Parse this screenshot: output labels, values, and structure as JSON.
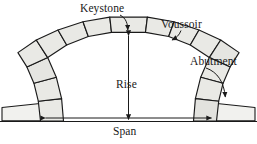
{
  "diagram": {
    "type": "engineering-cross-section",
    "colors": {
      "stone_fill": "#e9e9e5",
      "stone_fill_alt": "#dededa",
      "outline": "#1a1a1a",
      "background": "#ffffff",
      "text": "#1a1a1a"
    },
    "labels": {
      "keystone": "Keystone",
      "voussoir": "Voussoir",
      "abutment": "Abutment",
      "rise": "Rise",
      "span": "Span"
    },
    "callouts": [
      {
        "name": "keystone-callout",
        "label": "Keystone",
        "points_to": "top-center-wedge-block"
      },
      {
        "name": "voussoir-callout",
        "label": "Voussoir",
        "points_to": "upper-right-wedge-block"
      },
      {
        "name": "abutment-callout",
        "label": "Abutment",
        "points_to": "right-base-footing"
      }
    ],
    "dimensions": [
      {
        "name": "rise-dimension",
        "label": "Rise",
        "orientation": "vertical",
        "arrowheads": "both"
      },
      {
        "name": "span-dimension",
        "label": "Span",
        "orientation": "horizontal",
        "arrowheads": "both"
      }
    ],
    "parts": {
      "voussoir_count": 13,
      "keystone_index": 6,
      "abutment_count": 2,
      "ground_line": true
    }
  }
}
